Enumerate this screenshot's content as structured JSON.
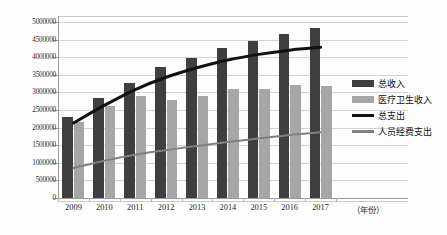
{
  "chart_data": {
    "type": "bar",
    "title": "",
    "xlabel": "（年份）",
    "ylabel": "",
    "categories": [
      "2009",
      "2010",
      "2011",
      "2012",
      "2013",
      "2014",
      "2015",
      "2016",
      "2017"
    ],
    "ylim": [
      0,
      5000000
    ],
    "ytick_values": [
      0,
      500000,
      1000000,
      1500000,
      2000000,
      2500000,
      3000000,
      3500000,
      4000000,
      4500000,
      5000000
    ],
    "ytick_labels": [
      "0",
      "500000",
      "1000000",
      "1500000",
      "2000000",
      "2500000",
      "3000000",
      "3500000",
      "4000000",
      "4500000",
      "5000000"
    ],
    "grid": true,
    "legend_position": "right",
    "series": [
      {
        "name": "总收入",
        "render": "bar",
        "color": "#3f3f3f",
        "values": [
          2300000,
          2830000,
          3260000,
          3730000,
          3980000,
          4250000,
          4460000,
          4650000,
          4830000
        ]
      },
      {
        "name": "医疗卫生收入",
        "render": "bar",
        "color": "#a6a6a6",
        "values": [
          2150000,
          2620000,
          2910000,
          2780000,
          2910000,
          3110000,
          3110000,
          3200000,
          3180000
        ]
      },
      {
        "name": "总支出",
        "render": "line",
        "color": "#111111",
        "values": [
          2130000,
          2630000,
          3080000,
          3430000,
          3700000,
          3920000,
          4080000,
          4200000,
          4280000
        ]
      },
      {
        "name": "人员经费支出",
        "render": "line",
        "color": "#808080",
        "values": [
          850000,
          1060000,
          1230000,
          1360000,
          1480000,
          1590000,
          1690000,
          1790000,
          1870000
        ]
      }
    ]
  },
  "legend": {
    "items": [
      {
        "label": "总收入",
        "swatch": "bar-dark"
      },
      {
        "label": "医疗卫生收入",
        "swatch": "bar-gray"
      },
      {
        "label": "总支出",
        "swatch": "line-dark"
      },
      {
        "label": "人员经费支出",
        "swatch": "line-gray"
      }
    ]
  }
}
